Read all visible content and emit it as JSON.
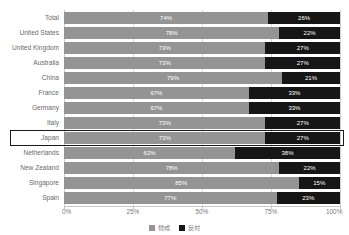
{
  "chart_data": {
    "type": "bar",
    "orientation": "horizontal",
    "stacked": true,
    "stacked_percent": true,
    "title": "",
    "xlabel": "",
    "ylabel": "",
    "xlim": [
      0,
      100
    ],
    "grid": true,
    "legend_position": "bottom",
    "x_tick_labels": [
      "0%",
      "25%",
      "50%",
      "75%",
      "100%"
    ],
    "x_tick_values": [
      0,
      25,
      50,
      75,
      100
    ],
    "categories": [
      "Total",
      "United States",
      "United Kingdom",
      "Australia",
      "China",
      "France",
      "Germany",
      "Italy",
      "Japan",
      "Netherlands",
      "New Zealand",
      "Singapore",
      "Spain"
    ],
    "series": [
      {
        "name": "賛成",
        "color": "#949494",
        "values": [
          74,
          78,
          73,
          73,
          79,
          67,
          67,
          73,
          73,
          62,
          78,
          85,
          77
        ],
        "labels": [
          "74%",
          "78%",
          "73%",
          "73%",
          "79%",
          "67%",
          "67%",
          "73%",
          "73%",
          "62%",
          "78%",
          "85%",
          "77%"
        ]
      },
      {
        "name": "反対",
        "color": "#161616",
        "values": [
          26,
          22,
          27,
          27,
          21,
          33,
          33,
          27,
          27,
          38,
          22,
          15,
          23
        ],
        "labels": [
          "26%",
          "22%",
          "27%",
          "27%",
          "21%",
          "33%",
          "33%",
          "27%",
          "27%",
          "38%",
          "22%",
          "15%",
          "23%"
        ]
      }
    ],
    "highlighted_category": "Japan",
    "legend": [
      {
        "label": "賛成",
        "color": "#949494"
      },
      {
        "label": "反対",
        "color": "#161616"
      }
    ]
  }
}
